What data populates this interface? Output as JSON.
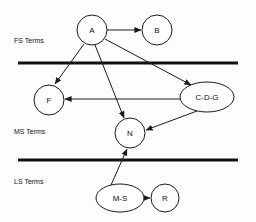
{
  "diagram": {
    "background_color": "#fdfdfd",
    "stroke_color": "#1a1a1a",
    "bands": [
      {
        "id": "fs",
        "label": "FS Terms",
        "label_x": 14,
        "label_y": 40
      },
      {
        "id": "ms",
        "label": "MS Terms",
        "label_x": 14,
        "label_y": 131
      },
      {
        "id": "ls",
        "label": "LS Terms",
        "label_x": 14,
        "label_y": 181
      }
    ],
    "dividers": [
      {
        "id": "divider-fs-ms",
        "x1": 18,
        "x2": 238,
        "y": 63,
        "thickness": 3
      },
      {
        "id": "divider-ms-ls",
        "x1": 18,
        "x2": 238,
        "y": 160,
        "thickness": 3
      }
    ],
    "nodes": [
      {
        "id": "A",
        "label": "A",
        "shape": "circle",
        "cx": 92,
        "cy": 30,
        "rx": 15,
        "ry": 15
      },
      {
        "id": "B",
        "label": "B",
        "shape": "circle",
        "cx": 157,
        "cy": 30,
        "rx": 15,
        "ry": 15
      },
      {
        "id": "F",
        "label": "F",
        "shape": "circle",
        "cx": 49,
        "cy": 100,
        "rx": 15,
        "ry": 15
      },
      {
        "id": "CDG",
        "label": "C-D-G",
        "shape": "ellipse",
        "cx": 207,
        "cy": 97,
        "rx": 27,
        "ry": 15
      },
      {
        "id": "N",
        "label": "N",
        "shape": "circle",
        "cx": 130,
        "cy": 133,
        "rx": 15,
        "ry": 15
      },
      {
        "id": "MS",
        "label": "M-S",
        "shape": "ellipse",
        "cx": 120,
        "cy": 198,
        "rx": 24,
        "ry": 14
      },
      {
        "id": "R",
        "label": "R",
        "shape": "circle",
        "cx": 165,
        "cy": 198,
        "rx": 14,
        "ry": 14
      }
    ],
    "edges": [
      {
        "id": "edge-a-b",
        "from": "A",
        "to": "B",
        "x1": 107,
        "y1": 30,
        "x2": 141,
        "y2": 30
      },
      {
        "id": "edge-a-f",
        "from": "A",
        "to": "F",
        "x1": 84,
        "y1": 44,
        "x2": 55,
        "y2": 84
      },
      {
        "id": "edge-a-n",
        "from": "A",
        "to": "N",
        "x1": 95,
        "y1": 45,
        "x2": 124,
        "y2": 118
      },
      {
        "id": "edge-a-cdg",
        "from": "A",
        "to": "CDG",
        "x1": 105,
        "y1": 39,
        "x2": 191,
        "y2": 85
      },
      {
        "id": "edge-cdg-f",
        "from": "CDG",
        "to": "F",
        "x1": 180,
        "y1": 99,
        "x2": 65,
        "y2": 99
      },
      {
        "id": "edge-cdg-n",
        "from": "CDG",
        "to": "N",
        "x1": 197,
        "y1": 111,
        "x2": 146,
        "y2": 130
      },
      {
        "id": "edge-ms-n",
        "from": "MS",
        "to": "N",
        "x1": 111,
        "y1": 185,
        "x2": 127,
        "y2": 149
      },
      {
        "id": "edge-ms-r",
        "from": "MS",
        "to": "R",
        "x1": 144,
        "y1": 198,
        "x2": 150,
        "y2": 198
      }
    ]
  }
}
